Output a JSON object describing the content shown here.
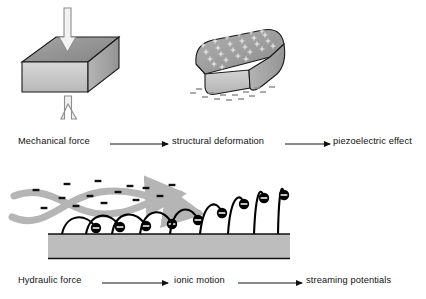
{
  "figure": {
    "title_visible": false,
    "background": "#ffffff",
    "width": 426,
    "height": 299
  },
  "colors": {
    "block_top": "#8f8f8f",
    "block_front": "#c9c9c9",
    "block_side": "#a8a8a8",
    "outline": "#1a1a1a",
    "flow_arrow": "#b5b5b5",
    "substrate": "#bdbdbd",
    "charge_fill": "#000000",
    "charge_text": "#ffffff",
    "text": "#111111",
    "arrow_line": "#111111",
    "hollow_arrow_stroke": "#8d8d8d",
    "hollow_arrow_fill": "#f2f2f2",
    "minus_gray": "#9a9a9a"
  },
  "panels": {
    "piezoelectric": {
      "name": "piezoelectric-panel",
      "undeformed_block": {
        "label": "undeformed-cuboid",
        "description": "isometric rectangular block"
      },
      "deformed_block": {
        "label": "deformed-cuboid",
        "description": "compressed rounded block with surface charges",
        "top_charge_symbol": "+",
        "bottom_charge_symbol": "–",
        "top_charge_count": 26,
        "bottom_charge_count": 14
      },
      "force_arrow_top": {
        "label": "downward-compression-arrow",
        "direction": "down"
      },
      "force_arrow_bottom": {
        "label": "upward-compression-arrow",
        "direction": "up"
      }
    },
    "streaming": {
      "name": "streaming-potential-panel",
      "substrate": {
        "label": "substrate-bar"
      },
      "flow_arrows": [
        {
          "label": "fluid-flow-ribbon-upper"
        },
        {
          "label": "fluid-flow-ribbon-lower"
        }
      ],
      "free_ions": {
        "symbol": "–",
        "count": 14
      },
      "tethered_charges": {
        "symbol": "–",
        "count": 9,
        "description": "charged spheres on flexible stalks, bent at left, upright at right"
      }
    }
  },
  "captions": {
    "top_row": {
      "name": "piezoelectric-caption-row",
      "steps": [
        "Mechanical force",
        "structural deformation",
        "piezoelectric effect"
      ]
    },
    "bottom_row": {
      "name": "streaming-caption-row",
      "steps": [
        "Hydraulic force",
        "ionic motion",
        "streaming potentials"
      ]
    }
  }
}
